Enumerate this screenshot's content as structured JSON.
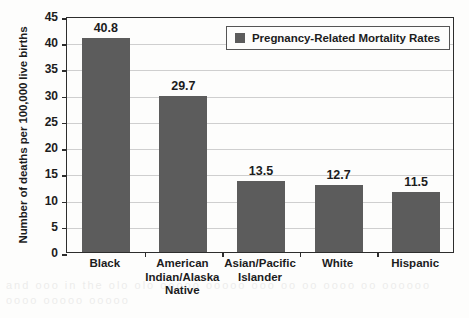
{
  "chart_data": {
    "type": "bar",
    "title": "",
    "xlabel": "",
    "ylabel": "Number of deaths per 100,000 live births",
    "categories": [
      "Black",
      "American Indian/Alaska Native",
      "Asian/Pacific Islander",
      "White",
      "Hispanic"
    ],
    "category_lines": [
      [
        "Black"
      ],
      [
        "American",
        "Indian/Alaska",
        "Native"
      ],
      [
        "Asian/Pacific",
        "Islander"
      ],
      [
        "White"
      ],
      [
        "Hispanic"
      ]
    ],
    "values": [
      40.8,
      29.7,
      13.5,
      12.7,
      11.5
    ],
    "value_labels": [
      "40.8",
      "29.7",
      "13.5",
      "12.7",
      "11.5"
    ],
    "series": [
      {
        "name": "Pregnancy-Related Mortality Rates",
        "values": [
          40.8,
          29.7,
          13.5,
          12.7,
          11.5
        ]
      }
    ],
    "ylim": [
      0,
      45
    ],
    "ytick_values": [
      0,
      5,
      10,
      15,
      20,
      25,
      30,
      35,
      40,
      45
    ],
    "ytick_labels": [
      "0",
      "5",
      "10",
      "15",
      "20",
      "25",
      "30",
      "35",
      "40",
      "45"
    ],
    "grid": true,
    "grid_axis": "y",
    "legend": {
      "position": "top-right-inside",
      "entries": [
        "Pregnancy-Related Mortality Rates"
      ]
    },
    "colors": {
      "bar": "#5c5c5c",
      "axis": "#2d2d2d",
      "grid": "#cfcfcf",
      "text": "#1c1c1c",
      "background": "#fdfdfc"
    }
  },
  "legend": {
    "swatch_color": "#5c5c5c",
    "label": "Pregnancy-Related Mortality Rates"
  },
  "artifact": {
    "bleed_text": "and ooo in the olo  olo ooooo  ooooo ooo oo oo oooo oo oooooo oooo ooooo ooooo"
  }
}
